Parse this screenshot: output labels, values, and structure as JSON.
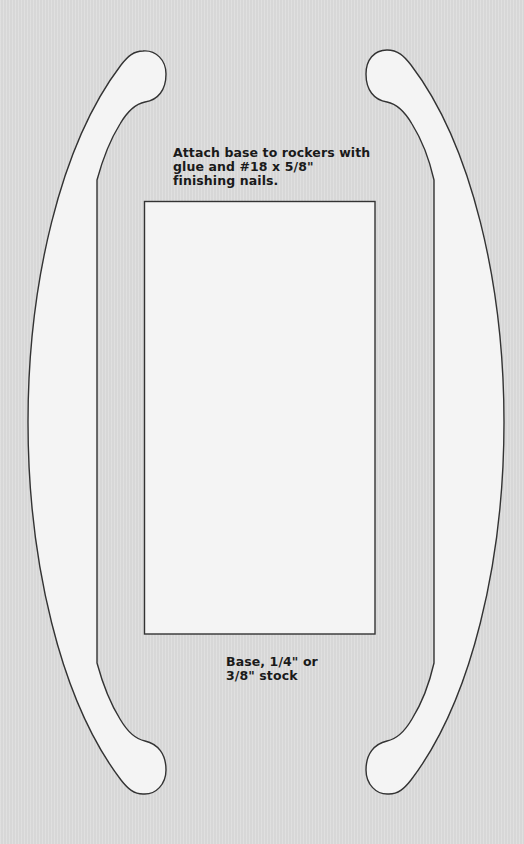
{
  "diagram": {
    "colors": {
      "background": "#dcdcdc",
      "part_fill": "#f4f4f4",
      "outline": "#333333",
      "text": "#1a1a1a"
    },
    "parts": [
      {
        "name": "left-rocker",
        "type": "curved rocker"
      },
      {
        "name": "right-rocker",
        "type": "curved rocker"
      },
      {
        "name": "base",
        "type": "rectangle",
        "x": 144,
        "y": 201,
        "width": 231,
        "height": 433
      }
    ],
    "annotations": {
      "attach_note": "Attach base to rockers with glue and #18 x 5/8\" finishing nails.",
      "base_label": "Base, 1/4\" or 3/8\" stock"
    }
  }
}
